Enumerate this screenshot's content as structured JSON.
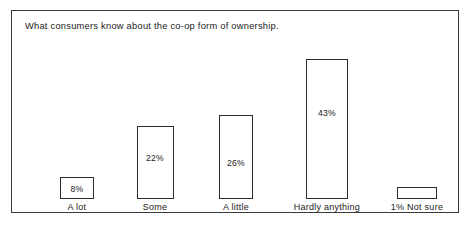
{
  "chart_data": {
    "type": "bar",
    "title": "What consumers know about the co-op form of ownership.",
    "xlabel": "",
    "ylabel": "",
    "ylim": [
      0,
      43
    ],
    "grid": false,
    "legend": "none",
    "categories": [
      "A lot",
      "Some",
      "A little",
      "Hardly anything",
      "Not sure"
    ],
    "values": [
      8,
      22,
      26,
      43,
      1
    ],
    "value_labels": [
      "8%",
      "22%",
      "26%",
      "43%",
      "1%"
    ],
    "bars": [
      {
        "label": "A lot",
        "value": 8,
        "value_label": "8%",
        "axis_label": "A lot",
        "label_inside": true
      },
      {
        "label": "Some",
        "value": 22,
        "value_label": "22%",
        "axis_label": "Some",
        "label_inside": true
      },
      {
        "label": "A little",
        "value": 26,
        "value_label": "26%",
        "axis_label": "A little",
        "label_inside": true
      },
      {
        "label": "Hardly anything",
        "value": 43,
        "value_label": "43%",
        "axis_label": "Hardly anything",
        "label_inside": true
      },
      {
        "label": "Not sure",
        "value": 1,
        "value_label": "1%",
        "axis_label": "1% Not sure",
        "label_inside": false
      }
    ],
    "colors": {
      "bar_fill": "#ffffff",
      "bar_outline": "#2b2b2b",
      "frame": "#3a3a3a",
      "background": "#ffffff",
      "text": "#1a1a1a"
    }
  }
}
